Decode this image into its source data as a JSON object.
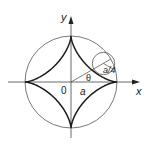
{
  "diagram": {
    "labels": {
      "x_axis": "x",
      "y_axis": "y",
      "origin": "0",
      "radius": "a",
      "angle": "θ",
      "small_radius": "a/4"
    },
    "colors": {
      "curve": "#1a1a1a",
      "circle": "#555555",
      "axis": "#444444",
      "background": "#ffffff"
    }
  }
}
